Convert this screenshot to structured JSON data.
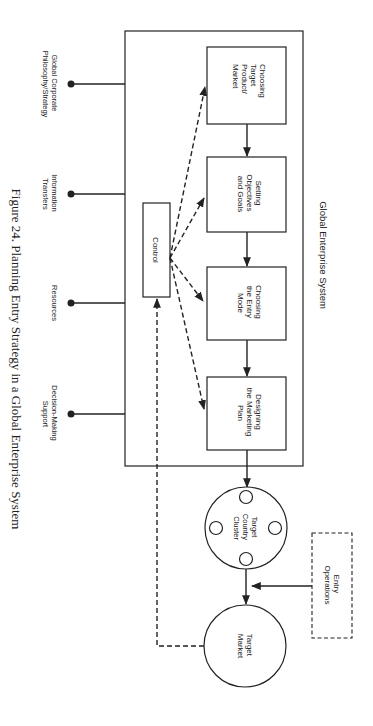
{
  "diagram": {
    "orientation": "rotated 90 degrees clockwise",
    "caption": "Figure 24.  Planning Entry Strategy in a Global Enterprise System",
    "system_label": "Global Enterprise System",
    "inputs": [
      {
        "lines": [
          "Global Corporate",
          "Philosophy/Strategy"
        ]
      },
      {
        "lines": [
          "Information",
          "Transfers"
        ]
      },
      {
        "lines": [
          "Resources"
        ]
      },
      {
        "lines": [
          "Decision-Making",
          "Support"
        ]
      }
    ],
    "process_steps": [
      {
        "lines": [
          "Choosing",
          "Target",
          "Product/",
          "Market"
        ]
      },
      {
        "lines": [
          "Setting",
          "Objectives",
          "and Goals"
        ]
      },
      {
        "lines": [
          "Choosing",
          "the Entry",
          "Mode"
        ]
      },
      {
        "lines": [
          "Designing",
          "the Marketing",
          "Plan"
        ]
      }
    ],
    "control": {
      "label": "Control"
    },
    "cluster": {
      "lines": [
        "Target",
        "Country",
        "Cluster"
      ]
    },
    "entry_operations": {
      "lines": [
        "Entry",
        "Operations"
      ]
    },
    "target_market": {
      "lines": [
        "Target",
        "Market"
      ]
    },
    "edges": [
      {
        "from": "Choosing Target Product/Market",
        "to": "Setting Objectives and Goals",
        "style": "solid"
      },
      {
        "from": "Setting Objectives and Goals",
        "to": "Choosing the Entry Mode",
        "style": "solid"
      },
      {
        "from": "Choosing the Entry Mode",
        "to": "Designing the Marketing Plan",
        "style": "solid"
      },
      {
        "from": "Designing the Marketing Plan",
        "to": "Target Country Cluster",
        "style": "solid"
      },
      {
        "from": "Target Country Cluster",
        "to": "Target Market",
        "style": "solid"
      },
      {
        "from": "Entry Operations",
        "to": "Target Country Cluster -> Target Market",
        "style": "solid"
      },
      {
        "from": "Control",
        "to": "Choosing Target Product/Market",
        "style": "dashed"
      },
      {
        "from": "Control",
        "to": "Setting Objectives and Goals",
        "style": "dashed"
      },
      {
        "from": "Control",
        "to": "Choosing the Entry Mode",
        "style": "dashed"
      },
      {
        "from": "Control",
        "to": "Designing the Marketing Plan",
        "style": "dashed"
      },
      {
        "from": "Target Market",
        "to": "Control",
        "style": "dashed"
      }
    ]
  }
}
